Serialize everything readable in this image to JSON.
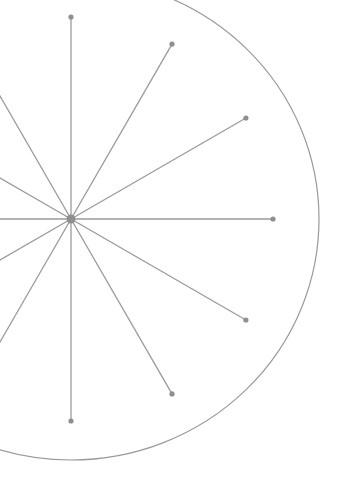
{
  "diagram": {
    "type": "radial-spokes",
    "center": {
      "x": 71,
      "y": 219
    },
    "spoke_count": 12,
    "spoke_angle_step_deg": 30,
    "spoke_length": 202,
    "outer_ring": {
      "rx": 248,
      "ry": 241
    },
    "colors": {
      "stroke": "#9a9a9a",
      "node": "#8f8f8f",
      "background": "#ffffff"
    }
  }
}
